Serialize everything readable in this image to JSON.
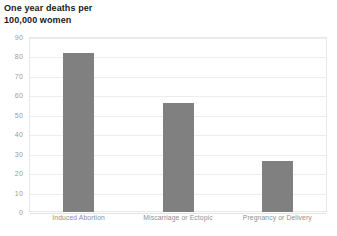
{
  "chart_data": {
    "type": "bar",
    "title": "One year deaths per 100,000 women",
    "title_lines": [
      "One year deaths per",
      "100,000 women"
    ],
    "categories": [
      "Induced Abortion",
      "Miscarriage or Ectopic",
      "Pregnancy or Delivery"
    ],
    "values": [
      82,
      56,
      26
    ],
    "xlabel": "",
    "ylabel": "",
    "ylim": [
      0,
      90
    ],
    "ytick_step": 10,
    "yticks": [
      90,
      80,
      70,
      60,
      50,
      40,
      30,
      20,
      10,
      0
    ],
    "grid": true,
    "legend": false,
    "bar_color": "#808080",
    "gridline_color": "#ededed",
    "plot_border_color": "#e8e8e8",
    "tick_label_color": "#9a9a9a",
    "title_color": "#1a1a1a"
  }
}
